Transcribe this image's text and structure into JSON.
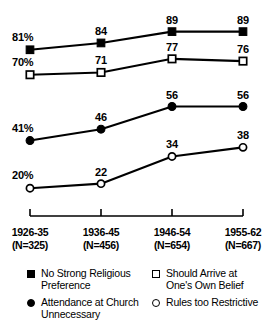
{
  "chart_data": {
    "type": "line",
    "title": "",
    "subtitle": "",
    "xlabel": "",
    "ylabel": "",
    "grid": false,
    "legend_position": "bottom",
    "ylim": [
      0,
      100
    ],
    "categories": [
      "1926-35",
      "1936-45",
      "1946-54",
      "1955-62"
    ],
    "category_n": [
      "(N=325)",
      "(N=456)",
      "(N=654)",
      "(N=667)"
    ],
    "series": [
      {
        "name": "No Strong Religious Preference",
        "marker": "filled-square",
        "values": [
          81,
          84,
          89,
          89
        ],
        "point_labels": [
          "81%",
          "84",
          "89",
          "89"
        ]
      },
      {
        "name": "Should Arrive at One's Own Belief",
        "marker": "open-square",
        "values": [
          70,
          71,
          77,
          76
        ],
        "point_labels": [
          "70%",
          "71",
          "77",
          "76"
        ]
      },
      {
        "name": "Attendance at Church Unnecessary",
        "marker": "filled-circle",
        "values": [
          41,
          46,
          56,
          56
        ],
        "point_labels": [
          "41%",
          "46",
          "56",
          "56"
        ]
      },
      {
        "name": "Rules too Restrictive",
        "marker": "open-circle",
        "values": [
          20,
          22,
          34,
          38
        ],
        "point_labels": [
          "20%",
          "22",
          "34",
          "38"
        ]
      }
    ]
  },
  "axis": {
    "ticks": [
      {
        "period": "1926-35",
        "n": "(N=325)"
      },
      {
        "period": "1936-45",
        "n": "(N=456)"
      },
      {
        "period": "1946-54",
        "n": "(N=654)"
      },
      {
        "period": "1955-62",
        "n": "(N=667)"
      }
    ]
  },
  "legend": {
    "left": [
      {
        "marker": "filled-square",
        "line1": "No Strong Religious",
        "line2": "Preference"
      },
      {
        "marker": "filled-circle",
        "line1": "Attendance at Church",
        "line2": "Unnecessary"
      }
    ],
    "right": [
      {
        "marker": "open-square",
        "line1": "Should Arrive at",
        "line2": "One's Own Belief"
      },
      {
        "marker": "open-circle",
        "line1": "Rules too Restrictive",
        "line2": ""
      }
    ]
  },
  "colors": {
    "ink": "#000000",
    "background": "#ffffff"
  }
}
